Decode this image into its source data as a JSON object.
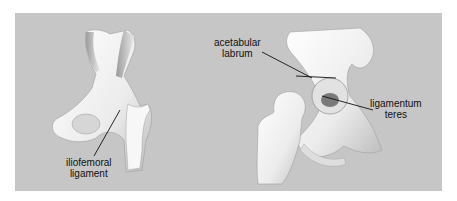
{
  "figure": {
    "left_panel": {
      "view": "anterior hip joint",
      "label": [
        "iliofemoral",
        "ligament"
      ]
    },
    "right_panel": {
      "view": "opened hip joint",
      "labels": {
        "acetabular_labrum": [
          "acetabular",
          "labrum"
        ],
        "ligamentum_teres": [
          "ligamentum",
          "teres"
        ]
      }
    },
    "colors": {
      "background": "#c6c6c6",
      "bone": "#f4f4f4",
      "text": "#111111"
    }
  }
}
